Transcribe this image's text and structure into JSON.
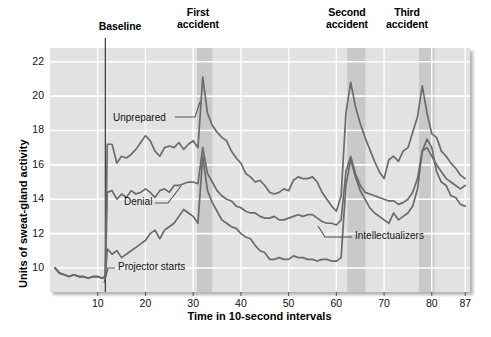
{
  "figure": {
    "title": "",
    "top_annotations": [
      {
        "name": "baseline",
        "label": "Baseline",
        "x_center": 120,
        "y": 21
      },
      {
        "name": "first-accident",
        "label": "First\naccident",
        "x_center": 198,
        "y": 7
      },
      {
        "name": "second-accident",
        "label": "Second\naccident",
        "x_center": 347,
        "y": 7
      },
      {
        "name": "third-accident",
        "label": "Third\naccident",
        "x_center": 406,
        "y": 7
      }
    ],
    "inline_annotations": [
      {
        "name": "unprepared",
        "label": "Unprepared",
        "x": 113,
        "y": 119
      },
      {
        "name": "denial",
        "label": "Denial",
        "x": 124,
        "y": 202
      },
      {
        "name": "intellectualizers",
        "label": "Intellectualizers",
        "x": 357,
        "y": 236
      },
      {
        "name": "projector-starts",
        "label": "Projector starts",
        "x": 118,
        "y": 266
      }
    ]
  },
  "chart_data": {
    "type": "line",
    "title": "",
    "subtitle": "",
    "xlabel": "Time in 10-second intervals",
    "ylabel": "Units of sweat-gland activity",
    "xlim": [
      0,
      88
    ],
    "ylim": [
      8.6,
      22.8
    ],
    "xticks": [
      10,
      20,
      30,
      40,
      50,
      60,
      70,
      80,
      87
    ],
    "yticks": [
      10,
      12,
      14,
      16,
      18,
      20,
      22
    ],
    "grid": true,
    "legend_position": "inline-labels",
    "line_color": "#6b6b6b",
    "plot_bg": "#e2e2e2",
    "grid_color": "#ffffff",
    "band_color": "#c9c9c9",
    "event_line": {
      "name": "projector-starts",
      "x": 11.6,
      "color": "#444444"
    },
    "bands": [
      {
        "name": "first-accident-band",
        "x0": 30.8,
        "x1": 34.0
      },
      {
        "name": "second-accident-band",
        "x0": 62.3,
        "x1": 66.1
      },
      {
        "name": "third-accident-band",
        "x0": 77.3,
        "x1": 80.6
      }
    ],
    "series": [
      {
        "name": "Unprepared",
        "x": [
          1,
          2,
          3,
          4,
          5,
          6,
          7,
          8,
          9,
          10,
          11,
          11.6,
          12,
          13,
          14,
          15,
          16,
          17,
          18,
          19,
          20,
          21,
          22,
          23,
          24,
          25,
          26,
          27,
          28,
          29,
          30,
          31,
          32,
          33,
          34,
          35,
          36,
          37,
          38,
          39,
          40,
          41,
          42,
          43,
          44,
          45,
          46,
          47,
          48,
          49,
          50,
          51,
          52,
          53,
          54,
          55,
          56,
          57,
          58,
          59,
          60,
          61,
          62,
          63,
          64,
          65,
          66,
          67,
          68,
          69,
          70,
          71,
          72,
          73,
          74,
          75,
          76,
          77,
          78,
          79,
          80,
          81,
          82,
          83,
          84,
          85,
          86,
          87
        ],
        "values": [
          10.0,
          9.7,
          9.6,
          9.5,
          9.6,
          9.5,
          9.5,
          9.4,
          9.5,
          9.5,
          9.4,
          9.5,
          17.2,
          17.2,
          16.1,
          16.5,
          16.4,
          16.6,
          16.9,
          17.3,
          17.7,
          17.4,
          16.8,
          16.5,
          17.0,
          17.1,
          17.0,
          17.3,
          16.9,
          17.2,
          17.4,
          17.0,
          21.1,
          19.0,
          18.3,
          17.9,
          17.6,
          17.4,
          16.8,
          16.4,
          16.1,
          15.5,
          15.3,
          15.0,
          15.1,
          14.8,
          14.4,
          14.3,
          14.4,
          14.6,
          14.5,
          15.1,
          15.3,
          15.2,
          15.2,
          15.3,
          15.0,
          14.4,
          14.0,
          13.6,
          13.3,
          14.2,
          19.0,
          20.8,
          19.4,
          18.4,
          17.6,
          16.9,
          16.2,
          15.6,
          15.2,
          16.3,
          16.5,
          16.2,
          16.8,
          17.0,
          17.9,
          18.8,
          20.6,
          19.0,
          17.8,
          17.6,
          16.8,
          16.5,
          16.1,
          15.8,
          15.4,
          15.2
        ],
        "label_note": "Top curve — unprepared participants"
      },
      {
        "name": "Denial",
        "x": [
          1,
          2,
          3,
          4,
          5,
          6,
          7,
          8,
          9,
          10,
          11,
          11.6,
          12,
          13,
          14,
          15,
          16,
          17,
          18,
          19,
          20,
          21,
          22,
          23,
          24,
          25,
          26,
          27,
          28,
          29,
          30,
          31,
          32,
          33,
          34,
          35,
          36,
          37,
          38,
          39,
          40,
          41,
          42,
          43,
          44,
          45,
          46,
          47,
          48,
          49,
          50,
          51,
          52,
          53,
          54,
          55,
          56,
          57,
          58,
          59,
          60,
          61,
          62,
          63,
          64,
          65,
          66,
          67,
          68,
          69,
          70,
          71,
          72,
          73,
          74,
          75,
          76,
          77,
          78,
          79,
          80,
          81,
          82,
          83,
          84,
          85,
          86,
          87
        ],
        "values": [
          10.0,
          9.7,
          9.6,
          9.5,
          9.6,
          9.5,
          9.5,
          9.4,
          9.5,
          9.5,
          9.4,
          9.5,
          14.4,
          14.5,
          14.0,
          14.3,
          14.1,
          14.5,
          14.3,
          14.4,
          14.6,
          14.4,
          14.1,
          14.5,
          14.6,
          14.4,
          14.8,
          14.8,
          14.9,
          15.0,
          15.0,
          14.9,
          17.0,
          15.5,
          15.0,
          14.5,
          14.2,
          14.0,
          13.9,
          13.6,
          13.5,
          13.3,
          13.2,
          13.2,
          13.0,
          12.9,
          12.9,
          13.0,
          12.8,
          12.8,
          12.9,
          13.0,
          13.1,
          13.0,
          13.1,
          13.1,
          12.9,
          12.7,
          12.6,
          12.6,
          12.5,
          12.8,
          15.6,
          16.5,
          15.5,
          14.8,
          14.4,
          14.3,
          14.2,
          14.1,
          14.0,
          13.9,
          13.9,
          13.7,
          13.8,
          14.0,
          14.4,
          15.2,
          16.8,
          17.0,
          16.5,
          16.0,
          15.6,
          15.2,
          15.0,
          14.8,
          14.6,
          14.8
        ],
        "label_note": "Middle curve — deniers"
      },
      {
        "name": "Intellectualizers",
        "x": [
          1,
          2,
          3,
          4,
          5,
          6,
          7,
          8,
          9,
          10,
          11,
          11.6,
          12,
          13,
          14,
          15,
          16,
          17,
          18,
          19,
          20,
          21,
          22,
          23,
          24,
          25,
          26,
          27,
          28,
          29,
          30,
          31,
          32,
          33,
          34,
          35,
          36,
          37,
          38,
          39,
          40,
          41,
          42,
          43,
          44,
          45,
          46,
          47,
          48,
          49,
          50,
          51,
          52,
          53,
          54,
          55,
          56,
          57,
          58,
          59,
          60,
          61,
          62,
          63,
          64,
          65,
          66,
          67,
          68,
          69,
          70,
          71,
          72,
          73,
          74,
          75,
          76,
          77,
          78,
          79,
          80,
          81,
          82,
          83,
          84,
          85,
          86,
          87
        ],
        "values": [
          10.0,
          9.7,
          9.6,
          9.5,
          9.6,
          9.5,
          9.5,
          9.4,
          9.5,
          9.5,
          9.4,
          9.5,
          11.1,
          10.8,
          11.0,
          10.6,
          10.8,
          11.0,
          11.2,
          11.4,
          11.6,
          12.0,
          12.2,
          11.7,
          12.2,
          12.4,
          12.6,
          13.0,
          13.4,
          13.2,
          13.0,
          12.6,
          16.5,
          14.5,
          13.8,
          13.3,
          12.8,
          12.6,
          12.4,
          12.3,
          12.0,
          11.8,
          11.7,
          11.3,
          11.0,
          10.9,
          10.5,
          10.5,
          10.6,
          10.5,
          10.5,
          10.7,
          10.6,
          10.6,
          10.5,
          10.5,
          10.4,
          10.5,
          10.5,
          10.4,
          10.4,
          10.6,
          14.8,
          16.3,
          15.3,
          14.5,
          14.0,
          13.5,
          13.2,
          13.0,
          12.8,
          12.6,
          13.2,
          12.8,
          13.0,
          13.2,
          13.6,
          14.6,
          16.8,
          17.5,
          17.0,
          15.6,
          15.0,
          14.8,
          14.2,
          14.1,
          13.7,
          13.6
        ],
        "label_note": "Bottom curve — intellectualizers"
      }
    ]
  }
}
